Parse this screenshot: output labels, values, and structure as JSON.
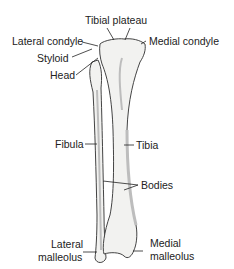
{
  "diagram": {
    "labels": {
      "tibial_plateau": "Tibial plateau",
      "lateral_condyle": "Lateral condyle",
      "medial_condyle": "Medial condyle",
      "styloid": "Styloid",
      "head": "Head",
      "fibula": "Fibula",
      "tibia": "Tibia",
      "bodies": "Bodies",
      "lateral_malleolus_1": "Lateral",
      "lateral_malleolus_2": "malleolus",
      "medial_malleolus_1": "Medial",
      "medial_malleolus_2": "malleolus"
    },
    "colors": {
      "bone_fill": "#f2f2f0",
      "bone_shade": "#bdbdbd",
      "outline": "#444444",
      "text": "#222222"
    }
  }
}
